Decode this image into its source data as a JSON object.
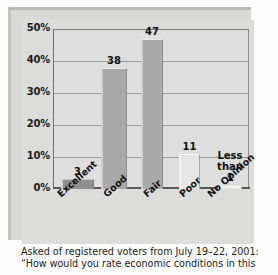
{
  "chart_data": {
    "type": "bar",
    "title": "",
    "categories": [
      "Excellent",
      "Good",
      "Fair",
      "Poor",
      "No Opinion"
    ],
    "values": [
      3,
      38,
      47,
      11,
      0.5
    ],
    "value_labels": [
      "3",
      "38",
      "47",
      "11",
      "Less than 1"
    ],
    "series": [
      {
        "name": "Rating of economic conditions",
        "values": [
          3,
          38,
          47,
          11,
          0.5
        ]
      }
    ],
    "xlabel": "",
    "ylabel": "",
    "ylim": [
      0,
      50
    ],
    "yticks": [
      0,
      10,
      20,
      30,
      40,
      50
    ],
    "ytick_labels": [
      "0%",
      "10%",
      "20%",
      "30%",
      "40%",
      "50%"
    ],
    "grid": true,
    "legend": false,
    "bar_styles": [
      "dark",
      "mid",
      "mid",
      "light",
      "light"
    ],
    "colors": {
      "bar_dark": "#8f8f8f",
      "bar_mid": "#a9a9a9",
      "bar_light": "#e6e6e6",
      "plot_background": "#dedede",
      "frame_background": "#dcdcda",
      "gridline": "#9a9a9a",
      "axis": "#5a5a5a",
      "text": "#111111"
    }
  },
  "caption": {
    "line1": "Asked of registered voters from July 19–22, 2001:",
    "line2": "“How would you rate economic conditions in this"
  }
}
